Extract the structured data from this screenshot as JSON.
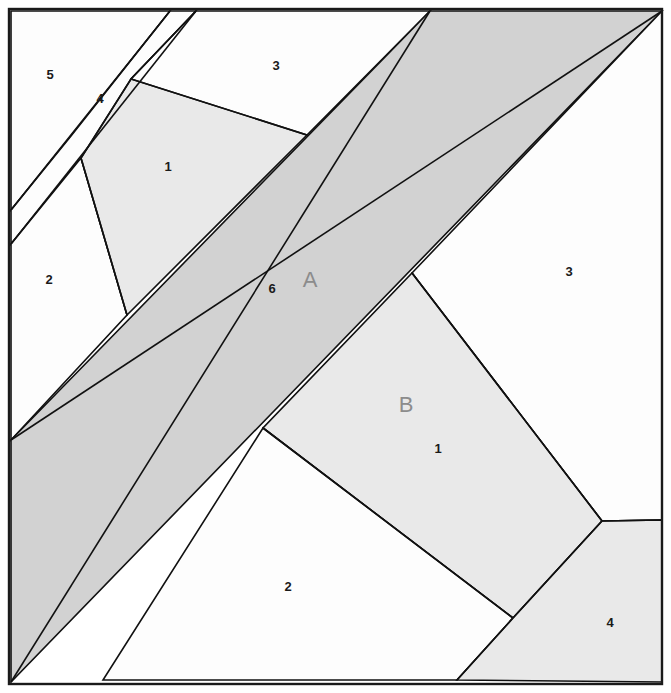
{
  "figure": {
    "canvas": {
      "width": 671,
      "height": 693
    },
    "frame": {
      "x": 9,
      "y": 9,
      "width": 653,
      "height": 675,
      "stroke": "#1a1a1a"
    },
    "colors": {
      "background": "#ffffff",
      "white_parcel": "#fdfdfd",
      "light_parcel": "#e9e9e9",
      "dark_band": "#d2d2d2",
      "edge_stroke": "#111111",
      "label_dark": "#1a1a1a",
      "label_gray": "#8c8c8c"
    },
    "regions": [
      {
        "name": "parcel-5",
        "label": "5",
        "fill": "white_parcel",
        "label_pos": {
          "x": 50,
          "y": 76
        },
        "points": "11,11 170,11 71,136 11,210"
      },
      {
        "name": "parcel-strip-4",
        "label": "4",
        "fill": "white_parcel",
        "label_pos": {
          "x": 100,
          "y": 100
        },
        "points": "170,11 196,11 81,158 11,244 11,210 71,136"
      },
      {
        "name": "parcel-2-left",
        "label": "2",
        "fill": "white_parcel",
        "label_pos": {
          "x": 49,
          "y": 281
        },
        "points": "81,158 127,315 11,440 11,244"
      },
      {
        "name": "parcel-1-upper",
        "label": "1",
        "fill": "light_parcel",
        "label_pos": {
          "x": 168,
          "y": 168
        },
        "points": "196,11 131,79 81,158 127,315 307,135"
      },
      {
        "name": "parcel-3-upper",
        "label": "3",
        "fill": "white_parcel",
        "label_pos": {
          "x": 276,
          "y": 67
        },
        "points": "196,11 430,11 307,135 131,79"
      },
      {
        "name": "band-A",
        "label": "A",
        "sublabel": "6",
        "fill": "dark_band",
        "label_pos": {
          "x": 310,
          "y": 281
        },
        "sublabel_pos": {
          "x": 272,
          "y": 290
        },
        "points": "430,11 662,11 11,682 11,440"
      },
      {
        "name": "parcel-3-right",
        "label": "3",
        "fill": "white_parcel",
        "label_pos": {
          "x": 569,
          "y": 273
        },
        "points": "662,11 662,520 602,521 412,273"
      },
      {
        "name": "parcel-B-1",
        "label": "B",
        "sublabel": "1",
        "fill": "light_parcel",
        "label_pos": {
          "x": 406,
          "y": 406
        },
        "sublabel_pos": {
          "x": 438,
          "y": 450
        },
        "points": "412,273 602,521 513,618 263,428"
      },
      {
        "name": "parcel-2-lower",
        "label": "2",
        "fill": "white_parcel",
        "label_pos": {
          "x": 288,
          "y": 588
        },
        "points": "263,428 513,618 457,680 103,680"
      },
      {
        "name": "parcel-4-lower-right",
        "label": "4",
        "fill": "light_parcel",
        "label_pos": {
          "x": 610,
          "y": 624
        },
        "points": "602,521 662,520 662,682 457,680 513,618"
      }
    ],
    "edges": [
      "170,11 11,210",
      "196,11 11,244",
      "81,158 127,315",
      "196,11 131,79 81,158",
      "131,79 307,135",
      "430,11 11,682",
      "662,11 11,440",
      "412,273 602,521",
      "602,521 513,618",
      "513,618 263,428",
      "513,618 457,680",
      "602,521 662,520"
    ]
  }
}
